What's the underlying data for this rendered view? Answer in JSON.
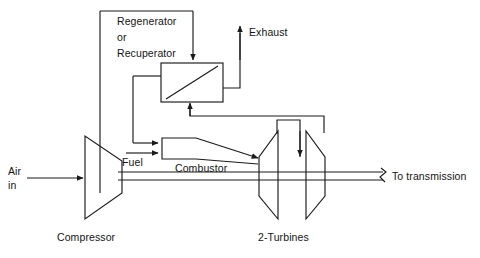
{
  "diagram": {
    "type": "process-flow-schematic",
    "labels": {
      "regenerator": "Regenerator",
      "regenerator_or": "or",
      "recuperator": "Recuperator",
      "exhaust": "Exhaust",
      "fuel": "Fuel",
      "combustor": "Combustor",
      "air_in_line1": "Air",
      "air_in_line2": "in",
      "compressor": "Compressor",
      "turbines": "2-Turbines",
      "to_transmission": "To transmission"
    },
    "components": [
      {
        "id": "compressor",
        "label": "Compressor",
        "shape": "trapezoid-expanding"
      },
      {
        "id": "regenerator",
        "label": "Regenerator or Recuperator",
        "shape": "heat-exchanger-box"
      },
      {
        "id": "combustor",
        "label": "Combustor",
        "shape": "tapered-duct"
      },
      {
        "id": "turbine-1",
        "label": "2-Turbines",
        "shape": "trapezoid-expanding"
      },
      {
        "id": "turbine-2",
        "label": "2-Turbines",
        "shape": "trapezoid-expanding"
      }
    ],
    "flows": [
      {
        "id": "air-inlet",
        "from": "ambient",
        "to": "compressor",
        "label": "Air in"
      },
      {
        "id": "compressor-to-regenerator",
        "from": "compressor",
        "to": "regenerator"
      },
      {
        "id": "regenerator-to-combustor",
        "from": "regenerator",
        "to": "combustor"
      },
      {
        "id": "fuel-inlet",
        "from": "fuel-supply",
        "to": "combustor",
        "label": "Fuel"
      },
      {
        "id": "combustor-to-turbine-1",
        "from": "combustor",
        "to": "turbine-1"
      },
      {
        "id": "turbine1-to-turbine2",
        "from": "turbine-1",
        "to": "turbine-2"
      },
      {
        "id": "turbine2-to-regenerator",
        "from": "turbine-2",
        "to": "regenerator"
      },
      {
        "id": "regenerator-exhaust",
        "from": "regenerator",
        "to": "ambient",
        "label": "Exhaust"
      },
      {
        "id": "output-shaft",
        "from": "turbine-2",
        "to": "transmission",
        "label": "To transmission"
      }
    ],
    "colors": {
      "line": "#1a1a1a",
      "text": "#141414",
      "background": "#ffffff"
    }
  }
}
